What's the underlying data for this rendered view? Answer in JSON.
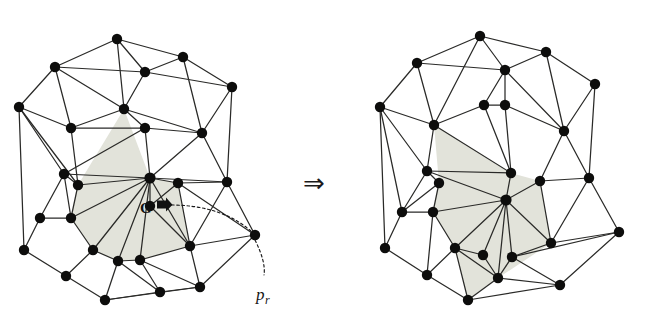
{
  "figure": {
    "background_color": "#ffffff",
    "edge_color": "#2a2a28",
    "node_color": "#0d0d0c",
    "cavity_color": "#e2e3da",
    "transition_symbol": "⇒",
    "transition_label": "implies"
  },
  "annotations": {
    "hub_label": "G",
    "removed_point_label": "p",
    "removed_point_subscript": "r"
  },
  "left_panel": {
    "name": "before-retriangulation",
    "nodes": [
      [
        117,
        39
      ],
      [
        183,
        57
      ],
      [
        55,
        67
      ],
      [
        145,
        72
      ],
      [
        232,
        87
      ],
      [
        19,
        107
      ],
      [
        124,
        109
      ],
      [
        71,
        128
      ],
      [
        145,
        128
      ],
      [
        202,
        133
      ],
      [
        64,
        174
      ],
      [
        150,
        178
      ],
      [
        178,
        183
      ],
      [
        227,
        182
      ],
      [
        40,
        218
      ],
      [
        78,
        185
      ],
      [
        71,
        218
      ],
      [
        150,
        206
      ],
      [
        24,
        250
      ],
      [
        93,
        250
      ],
      [
        118,
        261
      ],
      [
        140,
        260
      ],
      [
        190,
        246
      ],
      [
        255,
        235
      ],
      [
        66,
        276
      ],
      [
        105,
        300
      ],
      [
        160,
        292
      ],
      [
        200,
        287
      ]
    ],
    "edges": [
      [
        0,
        1
      ],
      [
        0,
        2
      ],
      [
        0,
        3
      ],
      [
        0,
        6
      ],
      [
        1,
        3
      ],
      [
        1,
        4
      ],
      [
        1,
        9
      ],
      [
        2,
        3
      ],
      [
        2,
        5
      ],
      [
        2,
        6
      ],
      [
        2,
        7
      ],
      [
        3,
        4
      ],
      [
        3,
        6
      ],
      [
        4,
        9
      ],
      [
        5,
        7
      ],
      [
        5,
        10
      ],
      [
        5,
        15
      ],
      [
        5,
        18
      ],
      [
        6,
        7
      ],
      [
        6,
        8
      ],
      [
        6,
        9
      ],
      [
        6,
        3
      ],
      [
        7,
        8
      ],
      [
        7,
        15
      ],
      [
        8,
        9
      ],
      [
        8,
        11
      ],
      [
        8,
        6
      ],
      [
        9,
        11
      ],
      [
        9,
        13
      ],
      [
        4,
        13
      ],
      [
        10,
        15
      ],
      [
        10,
        11
      ],
      [
        10,
        8
      ],
      [
        15,
        16
      ],
      [
        15,
        11
      ],
      [
        16,
        10
      ],
      [
        16,
        11
      ],
      [
        16,
        14
      ],
      [
        16,
        19
      ],
      [
        14,
        18
      ],
      [
        14,
        16
      ],
      [
        14,
        10
      ],
      [
        18,
        24
      ],
      [
        18,
        14
      ],
      [
        11,
        12
      ],
      [
        11,
        13
      ],
      [
        11,
        17
      ],
      [
        11,
        19
      ],
      [
        11,
        20
      ],
      [
        11,
        21
      ],
      [
        11,
        22
      ],
      [
        11,
        16
      ],
      [
        12,
        13
      ],
      [
        12,
        17
      ],
      [
        12,
        22
      ],
      [
        13,
        23
      ],
      [
        12,
        23
      ],
      [
        17,
        22
      ],
      [
        19,
        20
      ],
      [
        19,
        16
      ],
      [
        20,
        21
      ],
      [
        20,
        26
      ],
      [
        20,
        25
      ],
      [
        21,
        22
      ],
      [
        21,
        26
      ],
      [
        21,
        27
      ],
      [
        22,
        23
      ],
      [
        22,
        27
      ],
      [
        23,
        27
      ],
      [
        24,
        25
      ],
      [
        24,
        19
      ],
      [
        25,
        26
      ],
      [
        26,
        27
      ],
      [
        25,
        27
      ],
      [
        19,
        24
      ],
      [
        9,
        8
      ],
      [
        13,
        22
      ],
      [
        12,
        11
      ],
      [
        17,
        11
      ],
      [
        20,
        11
      ],
      [
        26,
        21
      ]
    ],
    "cavity_polygon": [
      [
        124,
        109
      ],
      [
        150,
        178
      ],
      [
        178,
        183
      ],
      [
        190,
        246
      ],
      [
        140,
        260
      ],
      [
        118,
        261
      ],
      [
        93,
        250
      ],
      [
        71,
        218
      ],
      [
        78,
        185
      ]
    ],
    "hub_index": 11,
    "hub_label_position": [
      151,
      210
    ],
    "removed_point": [
      255,
      235
    ],
    "leader_from": [
      166,
      205
    ],
    "leader_control": [
      222,
      204
    ],
    "leader_to": [
      253,
      233
    ],
    "tail_from": [
      255,
      240
    ],
    "tail_control": [
      266,
      262
    ],
    "tail_to": [
      264,
      275
    ],
    "p_label_position": [
      258,
      297
    ]
  },
  "right_panel": {
    "name": "after-retriangulation",
    "nodes": [
      [
        480,
        36
      ],
      [
        546,
        52
      ],
      [
        417,
        63
      ],
      [
        505,
        70
      ],
      [
        595,
        84
      ],
      [
        380,
        107
      ],
      [
        484,
        105
      ],
      [
        434,
        125
      ],
      [
        505,
        105
      ],
      [
        564,
        131
      ],
      [
        427,
        171
      ],
      [
        506,
        200
      ],
      [
        511,
        173
      ],
      [
        540,
        181
      ],
      [
        589,
        178
      ],
      [
        402,
        212
      ],
      [
        439,
        183
      ],
      [
        433,
        212
      ],
      [
        385,
        248
      ],
      [
        455,
        248
      ],
      [
        498,
        278
      ],
      [
        551,
        243
      ],
      [
        619,
        232
      ],
      [
        427,
        275
      ],
      [
        468,
        300
      ],
      [
        512,
        257
      ],
      [
        560,
        285
      ],
      [
        483,
        255
      ]
    ],
    "edges": [
      [
        0,
        1
      ],
      [
        0,
        2
      ],
      [
        0,
        3
      ],
      [
        0,
        7
      ],
      [
        1,
        3
      ],
      [
        1,
        4
      ],
      [
        1,
        9
      ],
      [
        2,
        3
      ],
      [
        2,
        5
      ],
      [
        2,
        7
      ],
      [
        3,
        6
      ],
      [
        3,
        8
      ],
      [
        3,
        9
      ],
      [
        4,
        9
      ],
      [
        4,
        14
      ],
      [
        5,
        7
      ],
      [
        5,
        10
      ],
      [
        5,
        15
      ],
      [
        5,
        18
      ],
      [
        6,
        7
      ],
      [
        6,
        8
      ],
      [
        6,
        12
      ],
      [
        7,
        10
      ],
      [
        7,
        12
      ],
      [
        8,
        9
      ],
      [
        8,
        12
      ],
      [
        9,
        13
      ],
      [
        9,
        14
      ],
      [
        10,
        12
      ],
      [
        10,
        15
      ],
      [
        10,
        16
      ],
      [
        10,
        11
      ],
      [
        12,
        11
      ],
      [
        13,
        11
      ],
      [
        13,
        14
      ],
      [
        13,
        21
      ],
      [
        14,
        21
      ],
      [
        14,
        22
      ],
      [
        15,
        16
      ],
      [
        15,
        17
      ],
      [
        15,
        18
      ],
      [
        16,
        17
      ],
      [
        16,
        10
      ],
      [
        17,
        11
      ],
      [
        17,
        19
      ],
      [
        17,
        23
      ],
      [
        18,
        23
      ],
      [
        18,
        15
      ],
      [
        11,
        19
      ],
      [
        11,
        21
      ],
      [
        11,
        25
      ],
      [
        11,
        27
      ],
      [
        11,
        20
      ],
      [
        11,
        13
      ],
      [
        11,
        17
      ],
      [
        19,
        23
      ],
      [
        19,
        27
      ],
      [
        19,
        20
      ],
      [
        20,
        25
      ],
      [
        20,
        24
      ],
      [
        20,
        26
      ],
      [
        21,
        22
      ],
      [
        21,
        25
      ],
      [
        22,
        26
      ],
      [
        23,
        24
      ],
      [
        24,
        26
      ],
      [
        24,
        20
      ],
      [
        25,
        26
      ],
      [
        27,
        20
      ],
      [
        25,
        22
      ],
      [
        27,
        19
      ],
      [
        19,
        24
      ],
      [
        23,
        19
      ]
    ],
    "cavity_polygon": [
      [
        434,
        125
      ],
      [
        511,
        173
      ],
      [
        540,
        181
      ],
      [
        551,
        243
      ],
      [
        498,
        278
      ],
      [
        468,
        300
      ],
      [
        455,
        248
      ],
      [
        433,
        212
      ],
      [
        439,
        183
      ]
    ],
    "hub_index": 11
  },
  "transition": {
    "symbol": "⇒",
    "x": 313,
    "y": 185
  }
}
